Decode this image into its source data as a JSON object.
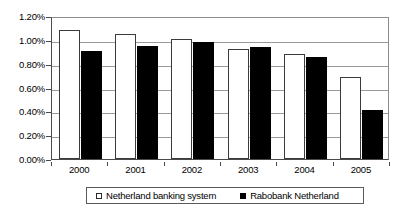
{
  "chart_data": {
    "type": "bar",
    "title": "",
    "subtitle": "",
    "xlabel": "",
    "ylabel": "",
    "categories": [
      "2000",
      "2001",
      "2002",
      "2003",
      "2004",
      "2005"
    ],
    "series": [
      {
        "name": "Netherland banking system",
        "swatch": "white",
        "color": "#ffffff",
        "values": [
          1.08,
          1.045,
          1.01,
          0.92,
          0.88,
          0.69
        ]
      },
      {
        "name": "Rabobank Netherland",
        "swatch": "black",
        "color": "#000000",
        "values": [
          0.91,
          0.945,
          0.985,
          0.94,
          0.855,
          0.41
        ]
      }
    ],
    "ylim": [
      0.0,
      1.2
    ],
    "y_tick_values": [
      0.0,
      0.2,
      0.4,
      0.6,
      0.8,
      1.0,
      1.2
    ],
    "y_tick_labels": [
      "0.00%",
      "0.20%",
      "0.40%",
      "0.60%",
      "0.80%",
      "1.00%",
      "1.20%"
    ],
    "value_suffix": "%",
    "grid": true,
    "grid_axis": "y",
    "legend_position": "bottom",
    "plot_border": true,
    "colors": {
      "grid": "#9a9a9a",
      "axis": "#4a4a4a",
      "text": "#000000",
      "background": "#ffffff"
    }
  }
}
